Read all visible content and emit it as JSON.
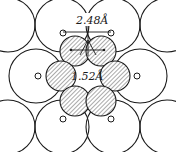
{
  "figure": {
    "labels": {
      "distance_top": "2.48Å",
      "distance_center": "1.52Å"
    },
    "colors": {
      "stroke": "#1a1a1a",
      "background": "#ffffff"
    },
    "large_atoms": {
      "count": 10
    },
    "hatched_atoms": {
      "count": 6
    },
    "open_small_atoms": {
      "count": 6
    }
  }
}
